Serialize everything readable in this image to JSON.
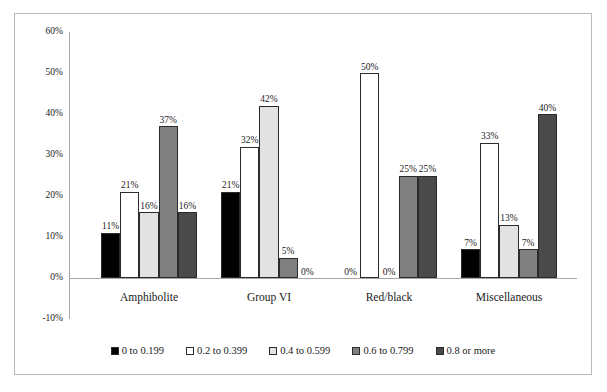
{
  "chart_data": {
    "type": "bar",
    "title": "",
    "subtitle": "",
    "xlabel": "",
    "ylabel": "",
    "ylim": [
      -10,
      60
    ],
    "y_ticks": [
      "60%",
      "50%",
      "40%",
      "30%",
      "20%",
      "10%",
      "0%",
      "-10%"
    ],
    "y_tick_values": [
      60,
      50,
      40,
      30,
      20,
      10,
      0,
      -10
    ],
    "grid": false,
    "legend_position": "bottom",
    "categories": [
      "Amphibolite",
      "Group VI",
      "Red/black",
      "Miscellaneous"
    ],
    "series": [
      {
        "name": "0 to 0.199",
        "color": "#000000",
        "values": [
          11,
          21,
          0,
          7
        ],
        "labels": [
          "11%",
          "21%",
          "0%",
          "7%"
        ]
      },
      {
        "name": "0.2 to 0.399",
        "color": "#ffffff",
        "values": [
          21,
          32,
          50,
          33
        ],
        "labels": [
          "21%",
          "32%",
          "50%",
          "33%"
        ]
      },
      {
        "name": "0.4 to 0.599",
        "color": "#e2e2e2",
        "values": [
          16,
          42,
          0,
          13
        ],
        "labels": [
          "16%",
          "42%",
          "0%",
          "13%"
        ]
      },
      {
        "name": "0.6 to 0.799",
        "color": "#808080",
        "values": [
          37,
          5,
          25,
          7
        ],
        "labels": [
          "37%",
          "5%",
          "25%",
          "7%"
        ]
      },
      {
        "name": "0.8 or more",
        "color": "#4a4a4a",
        "values": [
          16,
          0,
          25,
          40
        ],
        "labels": [
          "16%",
          "0%",
          "25%",
          "40%"
        ]
      }
    ]
  },
  "axis": {
    "ticks": [
      {
        "label": "60%",
        "value": 60
      },
      {
        "label": "50%",
        "value": 50
      },
      {
        "label": "40%",
        "value": 40
      },
      {
        "label": "30%",
        "value": 30
      },
      {
        "label": "20%",
        "value": 20
      },
      {
        "label": "10%",
        "value": 10
      },
      {
        "label": "0%",
        "value": 0
      },
      {
        "label": "-10%",
        "value": -10
      }
    ]
  },
  "legend": {
    "items": [
      {
        "label": "0 to 0.199",
        "color": "#000000"
      },
      {
        "label": "0.2 to 0.399",
        "color": "#ffffff"
      },
      {
        "label": "0.4 to 0.599",
        "color": "#e2e2e2"
      },
      {
        "label": "0.6 to 0.799",
        "color": "#808080"
      },
      {
        "label": "0.8 or more",
        "color": "#4a4a4a"
      }
    ]
  },
  "colors": {
    "axis_line": "#a6a6a6",
    "frame_border": "#b9b9b9",
    "bar_outline": "#2b2b2b",
    "text": "#1a1a1a",
    "background": "#ffffff"
  }
}
